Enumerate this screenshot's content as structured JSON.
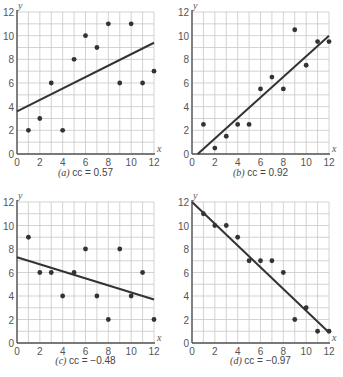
{
  "chart_data": [
    {
      "type": "scatter",
      "panel": "a",
      "caption_letter": "(a)",
      "caption_text": "cc = 0.57",
      "xlabel": "x",
      "ylabel": "y",
      "xlim": [
        0,
        12
      ],
      "ylim": [
        0,
        12
      ],
      "xticks": [
        0,
        2,
        4,
        6,
        8,
        10,
        12
      ],
      "yticks": [
        0,
        2,
        4,
        6,
        8,
        10,
        12
      ],
      "grid": true,
      "x": [
        1,
        2,
        3,
        4,
        5,
        6,
        7,
        8,
        9,
        10,
        11,
        12
      ],
      "y": [
        2,
        3,
        6,
        2,
        8,
        10,
        9,
        11,
        6,
        11,
        6,
        7
      ],
      "fit_line": [
        [
          0,
          3.6
        ],
        [
          12,
          9.4
        ]
      ]
    },
    {
      "type": "scatter",
      "panel": "b",
      "caption_letter": "(b)",
      "caption_text": "cc = 0.92",
      "xlabel": "x",
      "ylabel": "y",
      "xlim": [
        0,
        12
      ],
      "ylim": [
        0,
        12
      ],
      "xticks": [
        0,
        2,
        4,
        6,
        8,
        10,
        12
      ],
      "yticks": [
        0,
        2,
        4,
        6,
        8,
        10,
        12
      ],
      "grid": true,
      "x": [
        1,
        2,
        3,
        4,
        5,
        6,
        7,
        8,
        9,
        10,
        11,
        12
      ],
      "y": [
        2.5,
        0.5,
        1.5,
        2.5,
        2.5,
        5.5,
        6.5,
        5.5,
        10.5,
        7.5,
        9.5,
        9.5
      ],
      "fit_line": [
        [
          0.5,
          0
        ],
        [
          12,
          10
        ]
      ]
    },
    {
      "type": "scatter",
      "panel": "c",
      "caption_letter": "(c)",
      "caption_text": "cc = −0.48",
      "xlabel": "x",
      "ylabel": "y",
      "xlim": [
        0,
        12
      ],
      "ylim": [
        0,
        12
      ],
      "xticks": [
        0,
        2,
        4,
        6,
        8,
        10,
        12
      ],
      "yticks": [
        0,
        2,
        4,
        6,
        8,
        10,
        12
      ],
      "grid": true,
      "x": [
        1,
        2,
        3,
        4,
        5,
        6,
        7,
        8,
        9,
        10,
        11,
        12
      ],
      "y": [
        9,
        6,
        6,
        4,
        6,
        8,
        4,
        2,
        8,
        4,
        6,
        2
      ],
      "fit_line": [
        [
          0,
          7.3
        ],
        [
          12,
          3.7
        ]
      ]
    },
    {
      "type": "scatter",
      "panel": "d",
      "caption_letter": "(d)",
      "caption_text": "cc = −0.97",
      "xlabel": "x",
      "ylabel": "y",
      "xlim": [
        0,
        12
      ],
      "ylim": [
        0,
        12
      ],
      "xticks": [
        0,
        2,
        4,
        6,
        8,
        10,
        12
      ],
      "yticks": [
        0,
        2,
        4,
        6,
        8,
        10,
        12
      ],
      "grid": true,
      "x": [
        1,
        2,
        3,
        4,
        5,
        6,
        7,
        8,
        9,
        10,
        11,
        12
      ],
      "y": [
        11,
        10,
        10,
        9,
        7,
        7,
        7,
        6,
        2,
        3,
        1,
        1
      ],
      "fit_line": [
        [
          0,
          12
        ],
        [
          12,
          0.9
        ]
      ]
    }
  ],
  "style": {
    "grid_color": "#c8c8c8",
    "axis_color": "#555555",
    "point_color": "#333333",
    "line_color": "#333333"
  }
}
